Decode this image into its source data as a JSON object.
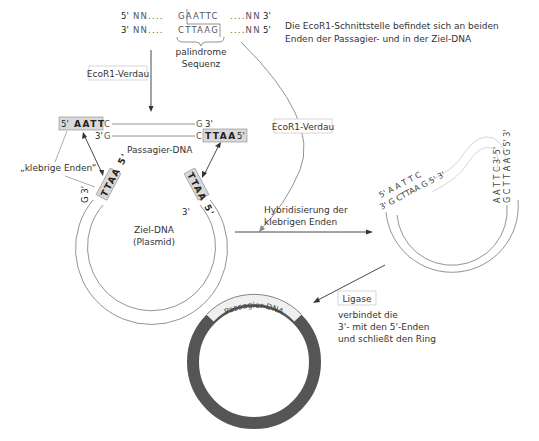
{
  "top_sequence": {
    "strand1": {
      "left_prime": "5'",
      "left_nn": "NN....",
      "seq": "GAATTC",
      "right_nn": "....NN",
      "right_prime": "3'"
    },
    "strand2": {
      "left_prime": "3'",
      "left_nn": "NN....",
      "seq": "CTTAAG",
      "right_nn": "....NN",
      "right_prime": "5'"
    },
    "palindrome_label_line1": "palindrome",
    "palindrome_label_line2": "Sequenz"
  },
  "description": {
    "line1": "Die EcoR1-Schnittstelle befindet sich an beiden",
    "line2": "Enden der Passagier- und in der Ziel-DNA"
  },
  "step1_label": "EcoR1-Verdau",
  "step2_label": "EcoR1-Verdau",
  "passenger": {
    "left_box": {
      "prime": "5'",
      "seq": "AATT"
    },
    "left_top_base": "C",
    "left_bottom": {
      "prime": "3'",
      "base": "G"
    },
    "right_top": {
      "base": "G",
      "prime": "3'"
    },
    "right_bottom_base": "C",
    "right_box": {
      "seq": "TTAA",
      "prime": "5'"
    },
    "label": "Passagier-DNA"
  },
  "sticky_ends_label": "„klebrige Enden“",
  "target": {
    "left_box": "TTAA 5'",
    "right_box": "TTAA 5'",
    "left_end": "G 3'",
    "right_end": "3'",
    "label_line1": "Ziel-DNA",
    "label_line2": "(Plasmid)"
  },
  "hybridization_label": {
    "line1": "Hybridisierung der",
    "line2": "klebrigen Enden"
  },
  "hybrid": {
    "left_top": "5' A A T T C",
    "left_bottom": "3' G CTTAA G 5' 3'",
    "right_top": "A A T T C 3' 5'",
    "right_bottom": "G C T T A A G 5' 3'"
  },
  "ligase": {
    "label": "Ligase",
    "desc_line1": "verbindet die",
    "desc_line2": "3'- mit den 5'-Enden",
    "desc_line3": "und schließt den Ring"
  },
  "final_ring_label": "Passagier-DNA",
  "colors": {
    "ring": "#555555",
    "sticky_box": "#d9d9d9",
    "passenger_band": "#f0f0f0"
  }
}
